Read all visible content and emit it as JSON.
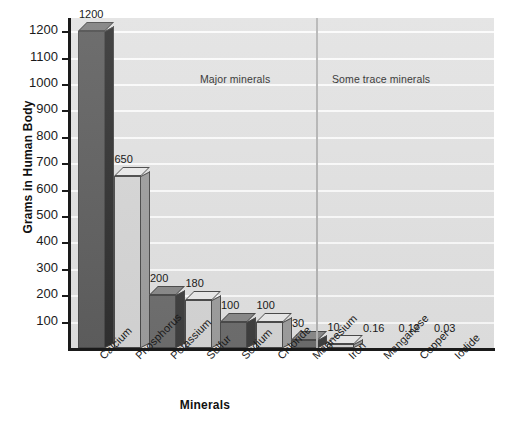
{
  "chart_data": {
    "type": "bar",
    "title": "",
    "xlabel": "Minerals",
    "ylabel": "Grams in Human Body",
    "ylim": [
      0,
      1250
    ],
    "ytick_labels": [
      "1200",
      "1100",
      "1000",
      "900",
      "800",
      "700",
      "600",
      "500",
      "400",
      "300",
      "200",
      "100"
    ],
    "ytick_values": [
      1200,
      1100,
      1000,
      900,
      800,
      700,
      600,
      500,
      400,
      300,
      200,
      100
    ],
    "grid": true,
    "legend": "none",
    "categories": [
      "Calcium",
      "Phosphorus",
      "Potassium",
      "Sulfur",
      "Sodium",
      "Chloride",
      "Magnesium",
      "Iron",
      "Manganese",
      "Copper",
      "Iodide"
    ],
    "values": [
      1200,
      650,
      200,
      180,
      100,
      100,
      30,
      10,
      0.16,
      0.12,
      0.03
    ],
    "value_labels": [
      "1200",
      "650",
      "200",
      "180",
      "100",
      "100",
      "30",
      "10",
      "0.16",
      "0.12",
      "0.03"
    ],
    "bar_shades": [
      "darkest",
      "light",
      "dark",
      "light",
      "dark",
      "light",
      "dark",
      "light",
      "none",
      "none",
      "none"
    ],
    "annotations": [
      {
        "text": "Major minerals",
        "position": "upper-left-group"
      },
      {
        "text": "Some trace minerals",
        "position": "upper-right-group"
      }
    ],
    "group_divider_after_category": "Magnesium",
    "colors": {
      "plot_background": "#e2e2e2",
      "gridline": "#fbfbfb",
      "bar_dark_face": "#6e6e6e",
      "bar_light_face": "#d6d6d6",
      "axis": "#1a1a1a",
      "divider": "#b4b4b4"
    }
  }
}
